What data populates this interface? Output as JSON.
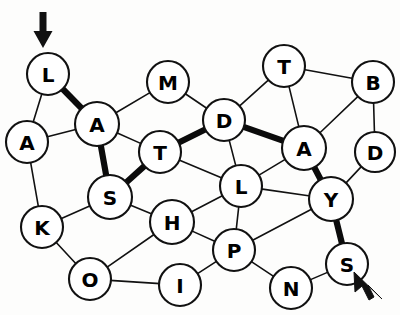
{
  "puzzle": {
    "title": "Letter Node Graph",
    "background_color": "#fdfdfc",
    "node_fill": "#ffffff",
    "node_stroke": "#111111",
    "edge_color": "#111111",
    "highlight_color": "#0b0b0b",
    "highlighted_word": "LASTDAYS",
    "nodes": [
      {
        "id": "L1",
        "label": "L",
        "x": 48,
        "y": 74,
        "r": 21
      },
      {
        "id": "A1",
        "label": "A",
        "x": 27,
        "y": 142,
        "r": 21
      },
      {
        "id": "A2",
        "label": "A",
        "x": 97,
        "y": 124,
        "r": 22
      },
      {
        "id": "M1",
        "label": "M",
        "x": 168,
        "y": 82,
        "r": 21
      },
      {
        "id": "T1",
        "label": "T",
        "x": 160,
        "y": 152,
        "r": 21
      },
      {
        "id": "D1",
        "label": "D",
        "x": 224,
        "y": 120,
        "r": 21
      },
      {
        "id": "T2",
        "label": "T",
        "x": 284,
        "y": 66,
        "r": 21
      },
      {
        "id": "B1",
        "label": "B",
        "x": 373,
        "y": 82,
        "r": 21
      },
      {
        "id": "A3",
        "label": "A",
        "x": 304,
        "y": 148,
        "r": 22
      },
      {
        "id": "D2",
        "label": "D",
        "x": 375,
        "y": 152,
        "r": 20
      },
      {
        "id": "S1",
        "label": "S",
        "x": 110,
        "y": 197,
        "r": 22
      },
      {
        "id": "L2",
        "label": "L",
        "x": 241,
        "y": 186,
        "r": 21
      },
      {
        "id": "Y1",
        "label": "Y",
        "x": 331,
        "y": 199,
        "r": 22
      },
      {
        "id": "K1",
        "label": "K",
        "x": 42,
        "y": 227,
        "r": 21
      },
      {
        "id": "H1",
        "label": "H",
        "x": 172,
        "y": 222,
        "r": 22
      },
      {
        "id": "P1",
        "label": "P",
        "x": 234,
        "y": 250,
        "r": 21
      },
      {
        "id": "S2",
        "label": "S",
        "x": 347,
        "y": 264,
        "r": 21
      },
      {
        "id": "O1",
        "label": "O",
        "x": 90,
        "y": 279,
        "r": 21
      },
      {
        "id": "I1",
        "label": "I",
        "x": 180,
        "y": 285,
        "r": 21
      },
      {
        "id": "N1",
        "label": "N",
        "x": 291,
        "y": 288,
        "r": 21
      }
    ],
    "edges": [
      {
        "from": "L1",
        "to": "A1",
        "bold": false
      },
      {
        "from": "L1",
        "to": "A2",
        "bold": true
      },
      {
        "from": "A1",
        "to": "A2",
        "bold": false
      },
      {
        "from": "A1",
        "to": "K1",
        "bold": false
      },
      {
        "from": "A2",
        "to": "M1",
        "bold": false
      },
      {
        "from": "A2",
        "to": "T1",
        "bold": false
      },
      {
        "from": "A2",
        "to": "S1",
        "bold": true
      },
      {
        "from": "M1",
        "to": "D1",
        "bold": false
      },
      {
        "from": "T1",
        "to": "S1",
        "bold": true
      },
      {
        "from": "T1",
        "to": "D1",
        "bold": true
      },
      {
        "from": "T1",
        "to": "L2",
        "bold": false
      },
      {
        "from": "D1",
        "to": "T2",
        "bold": false
      },
      {
        "from": "D1",
        "to": "A3",
        "bold": true
      },
      {
        "from": "D1",
        "to": "L2",
        "bold": false
      },
      {
        "from": "T2",
        "to": "B1",
        "bold": false
      },
      {
        "from": "T2",
        "to": "A3",
        "bold": false
      },
      {
        "from": "B1",
        "to": "A3",
        "bold": false
      },
      {
        "from": "B1",
        "to": "D2",
        "bold": false
      },
      {
        "from": "A3",
        "to": "L2",
        "bold": false
      },
      {
        "from": "A3",
        "to": "Y1",
        "bold": true
      },
      {
        "from": "D2",
        "to": "Y1",
        "bold": false
      },
      {
        "from": "S1",
        "to": "K1",
        "bold": false
      },
      {
        "from": "S1",
        "to": "H1",
        "bold": false
      },
      {
        "from": "L2",
        "to": "Y1",
        "bold": false
      },
      {
        "from": "L2",
        "to": "P1",
        "bold": false
      },
      {
        "from": "Y1",
        "to": "P1",
        "bold": false
      },
      {
        "from": "Y1",
        "to": "S2",
        "bold": true
      },
      {
        "from": "K1",
        "to": "O1",
        "bold": false
      },
      {
        "from": "H1",
        "to": "L2",
        "bold": false
      },
      {
        "from": "H1",
        "to": "P1",
        "bold": false
      },
      {
        "from": "H1",
        "to": "O1",
        "bold": false
      },
      {
        "from": "P1",
        "to": "I1",
        "bold": false
      },
      {
        "from": "P1",
        "to": "N1",
        "bold": false
      },
      {
        "from": "O1",
        "to": "I1",
        "bold": false
      },
      {
        "from": "N1",
        "to": "S2",
        "bold": false
      }
    ],
    "markers": [
      {
        "name": "start-arrow",
        "kind": "down-arrow",
        "x": 43,
        "y": 12,
        "length": 36
      },
      {
        "name": "end-cursor",
        "kind": "mouse-cursor",
        "x": 366,
        "y": 283
      }
    ]
  }
}
